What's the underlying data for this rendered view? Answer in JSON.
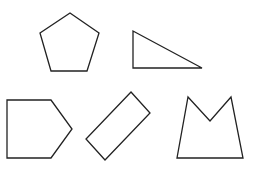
{
  "diagram": {
    "background": "#ffffff",
    "stroke_color": "#222222",
    "shapes": [
      {
        "id": "pentagon",
        "label": "regular pentagon",
        "points": "70,13 99,33 87,71 51,71 40,33"
      },
      {
        "id": "right-triangle",
        "label": "right triangle",
        "points": "133,31 133,68 202,68"
      },
      {
        "id": "house-pentagon",
        "label": "pentagon (house shape on side)",
        "points": "7,100 51,100 72,129 51,158 7,158"
      },
      {
        "id": "tilted-rectangle",
        "label": "rotated rectangle",
        "points": "131,92 150,113 105,160 86,139"
      },
      {
        "id": "m-shape",
        "label": "concave pentagon (crown / M shape)",
        "points": "188,97 210,121 231,97 243,158 177,158"
      }
    ]
  }
}
